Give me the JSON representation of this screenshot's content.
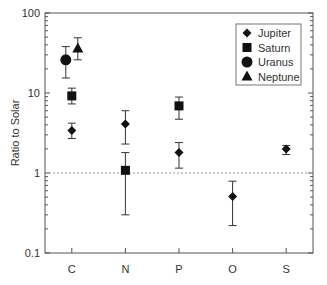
{
  "chart_data": {
    "type": "scatter",
    "title": "",
    "xlabel": "",
    "ylabel": "Ratio to Solar",
    "yscale": "log",
    "ylim": [
      0.1,
      100
    ],
    "yticks": [
      {
        "value": 100,
        "label": "100"
      },
      {
        "value": 10,
        "label": "10"
      },
      {
        "value": 1,
        "label": "1"
      },
      {
        "value": 0.1,
        "label": "0.1"
      }
    ],
    "categories": [
      "C",
      "N",
      "P",
      "O",
      "S"
    ],
    "reference_line": {
      "value": 1,
      "style": "dashed"
    },
    "legend": {
      "position": "upper right",
      "entries": [
        "Jupiter",
        "Saturn",
        "Uranus",
        "Neptune"
      ]
    },
    "series": [
      {
        "name": "Jupiter",
        "marker": "diamond",
        "points": [
          {
            "category": "C",
            "value": 3.4,
            "err_low": 2.7,
            "err_high": 4.2
          },
          {
            "category": "N",
            "value": 4.1,
            "err_low": 2.3,
            "err_high": 6.0
          },
          {
            "category": "P",
            "value": 1.8,
            "err_low": 1.15,
            "err_high": 2.4
          },
          {
            "category": "O",
            "value": 0.51,
            "err_low": 0.22,
            "err_high": 0.79
          },
          {
            "category": "S",
            "value": 2.0,
            "err_low": 1.7,
            "err_high": 2.2
          }
        ]
      },
      {
        "name": "Saturn",
        "marker": "square",
        "points": [
          {
            "category": "C",
            "value": 9.2,
            "err_low": 7.3,
            "err_high": 11.5
          },
          {
            "category": "N",
            "value": 1.08,
            "err_low": 0.3,
            "err_high": 1.8
          },
          {
            "category": "P",
            "value": 6.9,
            "err_low": 4.7,
            "err_high": 8.9
          }
        ]
      },
      {
        "name": "Uranus",
        "marker": "circle",
        "points": [
          {
            "category": "C",
            "value": 26,
            "err_low": 15.4,
            "err_high": 38
          }
        ]
      },
      {
        "name": "Neptune",
        "marker": "triangle",
        "points": [
          {
            "category": "C",
            "value": 36,
            "err_low": 26,
            "err_high": 49
          }
        ]
      }
    ]
  }
}
